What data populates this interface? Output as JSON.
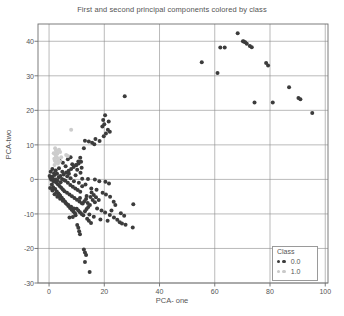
{
  "chart_data": {
    "type": "scatter",
    "title": "First and second principal components colored by class",
    "xlabel": "PCA- one",
    "ylabel": "PCA-two",
    "xlim": [
      -4,
      101
    ],
    "ylim": [
      -30,
      45
    ],
    "xticks": [
      0,
      20,
      40,
      60,
      80,
      100
    ],
    "yticks": [
      -30,
      -20,
      -10,
      0,
      10,
      20,
      30,
      40
    ],
    "grid": true,
    "legend": {
      "title": "Class",
      "position": "lower-right",
      "entries": [
        {
          "label": "0.0",
          "color": "#3c3c3c"
        },
        {
          "label": "1.0",
          "color": "#c9c9c9"
        }
      ]
    },
    "series": [
      {
        "name": "0.0",
        "color": "#3c3c3c",
        "points": [
          [
            68.3,
            42.3
          ],
          [
            70.5,
            39.9
          ],
          [
            71.0,
            39.7
          ],
          [
            70.2,
            40.0
          ],
          [
            71.6,
            39.3
          ],
          [
            73.4,
            38.3
          ],
          [
            72.7,
            38.6
          ],
          [
            62.0,
            38.2
          ],
          [
            63.6,
            38.2
          ],
          [
            55.3,
            33.9
          ],
          [
            61.0,
            30.8
          ],
          [
            78.6,
            33.7
          ],
          [
            79.3,
            33.0
          ],
          [
            86.9,
            26.7
          ],
          [
            90.3,
            23.6
          ],
          [
            91.0,
            23.2
          ],
          [
            95.3,
            19.2
          ],
          [
            74.4,
            22.3
          ],
          [
            81.0,
            22.3
          ],
          [
            27.4,
            24.1
          ],
          [
            20.3,
            18.6
          ],
          [
            19.6,
            17.2
          ],
          [
            21.6,
            16.8
          ],
          [
            20.0,
            16.0
          ],
          [
            19.3,
            15.3
          ],
          [
            21.3,
            14.4
          ],
          [
            22.0,
            13.8
          ],
          [
            20.6,
            13.3
          ],
          [
            19.8,
            12.5
          ],
          [
            18.3,
            11.1
          ],
          [
            13.0,
            11.2
          ],
          [
            14.4,
            11.0
          ],
          [
            15.6,
            10.6
          ],
          [
            16.4,
            10.2
          ],
          [
            16.8,
            11.7
          ],
          [
            12.6,
            9.0
          ],
          [
            11.3,
            6.3
          ],
          [
            10.6,
            5.2
          ],
          [
            9.8,
            4.2
          ],
          [
            11.8,
            3.4
          ],
          [
            12.0,
            0.2
          ],
          [
            14.1,
            0.1
          ],
          [
            16.6,
            0.0
          ],
          [
            18.2,
            -0.5
          ],
          [
            20.4,
            -0.7
          ],
          [
            21.7,
            -1.2
          ],
          [
            15.3,
            -2.6
          ],
          [
            17.2,
            -3.0
          ],
          [
            19.4,
            -3.9
          ],
          [
            20.6,
            -4.4
          ],
          [
            22.1,
            -5.0
          ],
          [
            13.6,
            -4.8
          ],
          [
            11.2,
            -5.4
          ],
          [
            23.4,
            -6.5
          ],
          [
            24.0,
            -7.4
          ],
          [
            30.5,
            -7.2
          ],
          [
            17.4,
            -8.4
          ],
          [
            19.0,
            -9.0
          ],
          [
            20.3,
            -9.6
          ],
          [
            22.0,
            -10.3
          ],
          [
            23.5,
            -11.0
          ],
          [
            24.7,
            -11.7
          ],
          [
            25.6,
            -12.4
          ],
          [
            26.4,
            -12.8
          ],
          [
            27.7,
            -13.1
          ],
          [
            30.3,
            -13.9
          ],
          [
            16.2,
            -10.8
          ],
          [
            14.6,
            -10.2
          ],
          [
            9.6,
            -10.4
          ],
          [
            8.6,
            -10.9
          ],
          [
            7.4,
            -11.0
          ],
          [
            10.2,
            -13.2
          ],
          [
            10.6,
            -14.0
          ],
          [
            10.9,
            -15.0
          ],
          [
            11.2,
            -15.9
          ],
          [
            12.6,
            -20.3
          ],
          [
            13.0,
            -21.2
          ],
          [
            13.4,
            -21.9
          ],
          [
            13.0,
            -23.9
          ],
          [
            14.7,
            -26.8
          ],
          [
            0.2,
            1.0
          ],
          [
            0.5,
            0.4
          ],
          [
            0.8,
            -0.1
          ],
          [
            1.1,
            0.8
          ],
          [
            1.4,
            0.2
          ],
          [
            1.7,
            -0.6
          ],
          [
            2.0,
            1.3
          ],
          [
            2.3,
            0.0
          ],
          [
            2.6,
            -0.9
          ],
          [
            2.9,
            1.6
          ],
          [
            3.2,
            -1.4
          ],
          [
            3.5,
            0.6
          ],
          [
            3.8,
            -1.9
          ],
          [
            4.1,
            1.0
          ],
          [
            4.4,
            -2.4
          ],
          [
            4.7,
            0.1
          ],
          [
            5.0,
            -2.9
          ],
          [
            5.3,
            1.4
          ],
          [
            5.6,
            -3.4
          ],
          [
            5.9,
            -0.4
          ],
          [
            6.2,
            2.0
          ],
          [
            6.5,
            -3.9
          ],
          [
            6.8,
            -1.0
          ],
          [
            7.1,
            2.5
          ],
          [
            7.4,
            -4.4
          ],
          [
            7.7,
            -1.6
          ],
          [
            8.0,
            3.0
          ],
          [
            8.3,
            -4.9
          ],
          [
            8.6,
            -2.1
          ],
          [
            8.9,
            3.6
          ],
          [
            9.2,
            -5.4
          ],
          [
            9.5,
            -2.6
          ],
          [
            9.8,
            4.1
          ],
          [
            10.1,
            -5.9
          ],
          [
            10.4,
            -3.1
          ],
          [
            10.7,
            4.6
          ],
          [
            11.0,
            -6.4
          ],
          [
            11.3,
            -3.6
          ],
          [
            11.6,
            5.1
          ],
          [
            11.9,
            -6.9
          ],
          [
            1.0,
            -1.5
          ],
          [
            1.5,
            -2.3
          ],
          [
            2.2,
            -2.8
          ],
          [
            2.8,
            -3.5
          ],
          [
            3.4,
            -4.1
          ],
          [
            4.0,
            -4.7
          ],
          [
            4.6,
            -5.3
          ],
          [
            5.2,
            -5.9
          ],
          [
            5.8,
            -6.5
          ],
          [
            6.4,
            -7.1
          ],
          [
            7.0,
            -7.7
          ],
          [
            7.6,
            -8.3
          ],
          [
            8.2,
            -8.8
          ],
          [
            8.8,
            -9.3
          ],
          [
            9.4,
            -9.8
          ],
          [
            10.0,
            -8.5
          ],
          [
            10.6,
            -9.0
          ],
          [
            11.2,
            -9.5
          ],
          [
            11.8,
            -10.0
          ],
          [
            12.4,
            -10.4
          ],
          [
            13.0,
            -9.2
          ],
          [
            13.6,
            -8.6
          ],
          [
            14.2,
            -8.0
          ],
          [
            14.8,
            -7.4
          ],
          [
            12.2,
            -7.0
          ],
          [
            12.8,
            -6.3
          ],
          [
            13.4,
            -5.7
          ],
          [
            14.0,
            -6.8
          ],
          [
            15.0,
            -5.1
          ],
          [
            15.8,
            -6.0
          ],
          [
            16.6,
            -6.6
          ],
          [
            12.0,
            -2.0
          ],
          [
            13.2,
            -1.5
          ],
          [
            10.8,
            -1.0
          ],
          [
            9.0,
            -0.5
          ],
          [
            7.8,
            0.3
          ],
          [
            6.6,
            0.9
          ],
          [
            5.4,
            -0.2
          ],
          [
            4.2,
            -0.8
          ],
          [
            3.0,
            -0.3
          ],
          [
            1.8,
            1.8
          ],
          [
            0.6,
            2.2
          ],
          [
            1.2,
            3.0
          ],
          [
            2.4,
            2.6
          ],
          [
            3.6,
            3.2
          ],
          [
            4.8,
            2.2
          ],
          [
            6.0,
            3.8
          ],
          [
            7.2,
            1.6
          ],
          [
            8.4,
            4.4
          ],
          [
            9.6,
            1.2
          ],
          [
            10.2,
            2.8
          ],
          [
            11.4,
            1.9
          ],
          [
            2.0,
            -4.3
          ],
          [
            3.0,
            -5.0
          ],
          [
            4.0,
            -5.6
          ],
          [
            5.0,
            -6.2
          ],
          [
            6.0,
            -6.8
          ],
          [
            7.0,
            -7.4
          ],
          [
            8.0,
            -7.9
          ],
          [
            9.0,
            -8.4
          ],
          [
            1.2,
            -3.2
          ],
          [
            2.6,
            -3.9
          ],
          [
            3.8,
            -4.5
          ],
          [
            0.4,
            -2.5
          ],
          [
            15.4,
            -3.8
          ],
          [
            16.2,
            -4.5
          ],
          [
            17.0,
            -5.2
          ],
          [
            18.0,
            -6.0
          ],
          [
            14.4,
            -12.0
          ],
          [
            15.2,
            -12.6
          ],
          [
            13.8,
            -11.4
          ],
          [
            18.6,
            -11.6
          ],
          [
            21.2,
            -12.0
          ],
          [
            26.0,
            -9.8
          ],
          [
            27.2,
            -10.5
          ],
          [
            22.6,
            -9.0
          ],
          [
            6.8,
            5.8
          ],
          [
            7.8,
            6.4
          ],
          [
            5.0,
            4.8
          ],
          [
            3.8,
            5.4
          ]
        ]
      },
      {
        "name": "1.0",
        "color": "#cccccc",
        "points": [
          [
            2.2,
            9.0
          ],
          [
            2.5,
            8.4
          ],
          [
            2.8,
            8.0
          ],
          [
            3.0,
            7.4
          ],
          [
            2.4,
            6.9
          ],
          [
            2.9,
            6.3
          ],
          [
            3.3,
            5.8
          ],
          [
            2.1,
            5.4
          ],
          [
            1.9,
            6.0
          ],
          [
            3.6,
            8.6
          ],
          [
            4.0,
            7.9
          ],
          [
            2.6,
            5.0
          ],
          [
            6.2,
            7.1
          ],
          [
            6.8,
            6.8
          ],
          [
            8.0,
            14.4
          ],
          [
            3.2,
            4.6
          ],
          [
            2.0,
            4.2
          ],
          [
            4.4,
            6.4
          ],
          [
            1.7,
            7.6
          ],
          [
            3.9,
            5.2
          ]
        ]
      }
    ]
  }
}
